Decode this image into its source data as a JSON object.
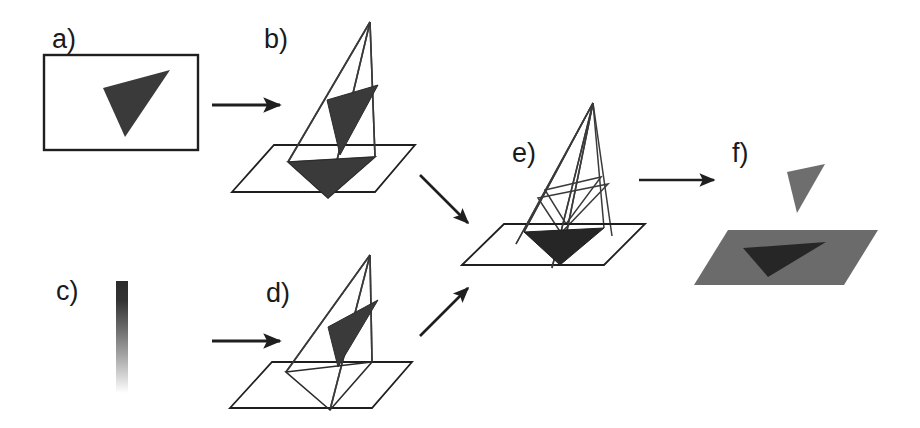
{
  "figure": {
    "background_color": "#ffffff",
    "width": 920,
    "height": 428,
    "stroke_color": "#1f1f1f",
    "panel_count": 6
  },
  "colors": {
    "ink": "#1f1f1f",
    "wireframe": "#3a3a3a",
    "dark_fill": "#3a3a3a",
    "darker_fill": "#262626",
    "plane_fill": "#6b6b6b",
    "floating_fill": "#6e6e6e",
    "white": "#ffffff",
    "gradient_top": "#2b2b2b",
    "gradient_bottom": "#ffffff"
  },
  "panels": [
    {
      "id": "a",
      "label": "a)",
      "label_x": 52,
      "label_y": 48,
      "description": "input image frame containing a dark triangle silhouette",
      "kind": "image-frame",
      "frame": {
        "x": 44,
        "y": 55,
        "width": 154,
        "height": 95
      },
      "triangle": "103,88 170,70 125,137",
      "triangle_fill": "#3a3a3a"
    },
    {
      "id": "b",
      "label": "b)",
      "label_x": 264,
      "label_y": 48,
      "description": "projection cone from camera apex through image triangle onto ground plane, filled shadow",
      "kind": "cone-plane",
      "apex": "370,22",
      "plane": "232,192 274,145 415,145 375,192",
      "cone_triangle": "327,100 378,85 340,155",
      "cone_triangle_fill": "#3a3a3a",
      "ground_triangle": "288,162 375,157 328,198",
      "ground_triangle_fill": "#3a3a3a",
      "ground_triangle_outlined": false
    },
    {
      "id": "c",
      "label": "c)",
      "label_x": 56,
      "label_y": 300,
      "description": "vertical intensity gradient bar, dark at top fading to white at bottom",
      "kind": "gradient-bar",
      "bar": {
        "x": 116,
        "y": 281,
        "width": 12,
        "height": 112
      }
    },
    {
      "id": "d",
      "label": "d)",
      "label_x": 266,
      "label_y": 302,
      "description": "projection cone with outlined (unfilled) ground triangle",
      "kind": "cone-plane",
      "apex": "370,255",
      "plane": "230,408 272,362 412,362 372,408",
      "cone_triangle": "328,327 378,300 338,367",
      "cone_triangle_fill": "#3a3a3a",
      "ground_triangle": "286,372 372,362 330,410",
      "ground_triangle_fill": "none",
      "ground_triangle_outlined": true
    },
    {
      "id": "e",
      "label": "e)",
      "label_x": 512,
      "label_y": 162,
      "description": "two intersecting projection cones sharing one apex, intersection shadow filled dark on the plane",
      "kind": "dual-cone-plane",
      "apex": "593,103",
      "plane": "462,265 504,224 645,224 604,265",
      "ground_triangle": "524,232 604,228 560,265",
      "ground_triangle_fill": "#262626"
    },
    {
      "id": "f",
      "label": "f)",
      "label_x": 732,
      "label_y": 162,
      "description": "result: recovered 3D triangle floating above the recovered shaded ground plane with its shadow",
      "kind": "result",
      "plane": "694,285 728,230 878,230 844,285",
      "plane_fill": "#6b6b6b",
      "shadow_triangle": "743,248 826,242 768,277",
      "shadow_triangle_fill": "#262626",
      "floating_triangle": "787,172 825,164 797,213",
      "floating_triangle_fill": "#6e6e6e"
    }
  ],
  "arrows": [
    {
      "name": "arrow-a-to-b",
      "from_panel": "a",
      "to_panel": "b",
      "x1": 212,
      "y1": 105,
      "x2": 282,
      "y2": 105,
      "direction": "right"
    },
    {
      "name": "arrow-c-to-d",
      "from_panel": "c",
      "to_panel": "d",
      "x1": 212,
      "y1": 341,
      "x2": 282,
      "y2": 341,
      "direction": "right"
    },
    {
      "name": "arrow-b-to-e",
      "from_panel": "b",
      "to_panel": "e",
      "x1": 420,
      "y1": 175,
      "x2": 470,
      "y2": 225,
      "direction": "down-right"
    },
    {
      "name": "arrow-d-to-e",
      "from_panel": "d",
      "to_panel": "e",
      "x1": 420,
      "y1": 336,
      "x2": 470,
      "y2": 286,
      "direction": "up-right"
    },
    {
      "name": "arrow-e-to-f",
      "from_panel": "e",
      "to_panel": "f",
      "x1": 639,
      "y1": 180,
      "x2": 716,
      "y2": 180,
      "direction": "right"
    }
  ]
}
